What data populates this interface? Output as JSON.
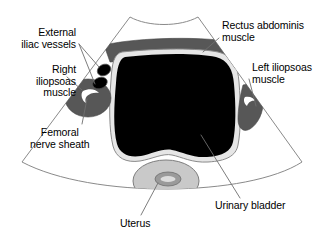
{
  "figure": {
    "type": "medical-illustration",
    "background_color": "#ffffff",
    "sector": {
      "name": "ultrasound-sector-field",
      "outline_color": "#8a8a8a",
      "fill_color": "#ffffff"
    }
  },
  "labels": {
    "external_iliac_vessels": "External\niliac vessels",
    "right_iliopsoas_muscle": "Right\niliopsoas\nmuscle",
    "femoral_nerve_sheath": "Femoral\nnerve sheath",
    "rectus_abdominis_muscle": "Rectus abdominis\nmuscle",
    "left_iliopsoas_muscle": "Left iliopsoas\nmuscle",
    "urinary_bladder": "Urinary bladder",
    "uterus": "Uterus"
  },
  "structures": [
    {
      "key": "rectus_abdominis_muscle",
      "label": "Rectus abdominis muscle",
      "fill": "#575757",
      "stroke": "#3d3d3d"
    },
    {
      "key": "urinary_bladder",
      "label": "Urinary bladder",
      "fill": "#000000",
      "wall_fill": "#e2e2e2",
      "wall_stroke": "#8a8a8a"
    },
    {
      "key": "right_iliopsoas_muscle",
      "label": "Right iliopsoas muscle",
      "fill": "#575757",
      "stroke": "#3d3d3d"
    },
    {
      "key": "femoral_nerve_sheath",
      "label": "Femoral nerve sheath",
      "fill": "#ffffff",
      "stroke": "#ffffff"
    },
    {
      "key": "left_iliopsoas_muscle",
      "label": "Left iliopsoas muscle",
      "fill": "#575757",
      "stroke": "#3d3d3d"
    },
    {
      "key": "external_iliac_vessels",
      "label": "External iliac vessels",
      "count": 2,
      "fill": "#000000",
      "stroke": "#4a4a4a"
    },
    {
      "key": "uterus",
      "label": "Uterus",
      "fill": "#c9c9c9",
      "stroke": "#7d7d7d",
      "endometrium_fill": "#9a9a9a",
      "endometrium_inner_fill": "#d8d8d8"
    }
  ],
  "leader_lines": {
    "stroke": "#6e6e6e",
    "stroke_width": 0.9
  }
}
